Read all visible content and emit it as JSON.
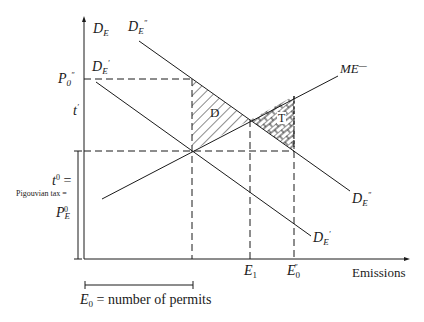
{
  "diagram": {
    "type": "economics supply-demand diagram (emissions permits vs Pigouvian tax)",
    "axes": {
      "x_label": "Emissions",
      "y_label": "D_E"
    },
    "curves": {
      "d_e_double_prime": {
        "label_main": "D",
        "label_sub": "E",
        "label_sup": "″"
      },
      "d_e_prime": {
        "label_main": "D",
        "label_sub": "E",
        "label_sup": "′"
      },
      "me": {
        "label": "ME",
        "label_sup": "—"
      }
    },
    "y_labels": {
      "p0_double_prime": {
        "main": "P",
        "sub": "0",
        "sup": "″"
      },
      "t_prime": {
        "main": "t",
        "sup": "′"
      },
      "t0": {
        "main": "t",
        "sup": "0",
        "suffix": " ="
      },
      "pigouvian": "Pigouvian tax =",
      "pe0": {
        "main": "P",
        "sub": "E",
        "sup": "0"
      }
    },
    "x_labels": {
      "e1": {
        "main": "E",
        "sub": "1"
      },
      "e0_double_prime": {
        "main": "E",
        "sub": "0",
        "sup": "″"
      }
    },
    "regions": {
      "d": "D",
      "t": "T"
    },
    "bracket_caption": {
      "main": "E",
      "sub": "0",
      "rest": " = number of permits"
    },
    "colors": {
      "line": "#1a1a1a",
      "background": "#ffffff"
    }
  }
}
